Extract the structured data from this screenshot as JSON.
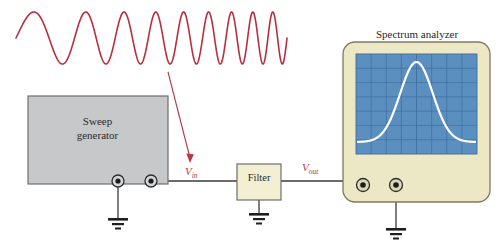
{
  "figure": {
    "background_color": "#ffffff"
  },
  "waveform": {
    "name": "swept-frequency-sine-chirp",
    "color": "#b5303f",
    "stroke_width": 1.6,
    "x_start": 16,
    "x_end": 287,
    "baseline_y": 38,
    "amplitude": 26,
    "cycles": 9,
    "description": "Sine wave sweeping from low to high frequency (chirp)"
  },
  "sweep_generator": {
    "label_line1": "Sweep",
    "label_line2": "generator",
    "fill_color": "#c6c8ca",
    "border_color": "#6e6e6e",
    "x": 28,
    "y": 96,
    "width": 140,
    "height": 88,
    "terminals": [
      {
        "name": "ground-terminal",
        "cx": 118,
        "cy": 181
      },
      {
        "name": "output-terminal",
        "cx": 151,
        "cy": 181
      }
    ]
  },
  "filter": {
    "label": "Filter",
    "fill_color": "#f2efd2",
    "border_color": "#6e6e6e",
    "x": 237,
    "y": 164,
    "width": 44,
    "height": 36
  },
  "spectrum_analyzer": {
    "caption": "Spectrum analyzer",
    "body_fill": "#ece7c4",
    "body_border": "#7d7a5d",
    "x": 343,
    "y": 42,
    "width": 147,
    "height": 160,
    "corner_radius": 12,
    "screen": {
      "fill": "#5b8fc0",
      "grid_color": "#3f6f9e",
      "x": 356,
      "y": 54,
      "width": 121,
      "height": 100,
      "grid_columns": 8,
      "grid_rows": 7
    },
    "trace": {
      "name": "bandpass-response-curve",
      "color": "#ffffff",
      "stroke_width": 2.2,
      "shape": "bell"
    },
    "terminals": [
      {
        "name": "input-terminal",
        "cx": 363,
        "cy": 185
      },
      {
        "name": "ground-terminal",
        "cx": 396,
        "cy": 185
      }
    ]
  },
  "labels": {
    "v_in": {
      "symbol": "V",
      "subscript": "in",
      "color": "#b03a48"
    },
    "v_out": {
      "symbol": "V",
      "subscript": "out",
      "color": "#b03a48"
    }
  },
  "annotations": {
    "pointer_arrow": {
      "name": "chirp-to-vin-arrow",
      "color": "#b03a48",
      "from_x": 168,
      "from_y": 72,
      "to_x": 191,
      "to_y": 162
    }
  },
  "grounds": [
    {
      "name": "sweep-generator-ground",
      "x": 118,
      "y": 218
    },
    {
      "name": "filter-ground",
      "x": 259,
      "y": 213
    },
    {
      "name": "spectrum-analyzer-ground",
      "x": 396,
      "y": 228
    }
  ],
  "wires": {
    "color": "#3a3a3a",
    "stroke_width": 1.3
  }
}
